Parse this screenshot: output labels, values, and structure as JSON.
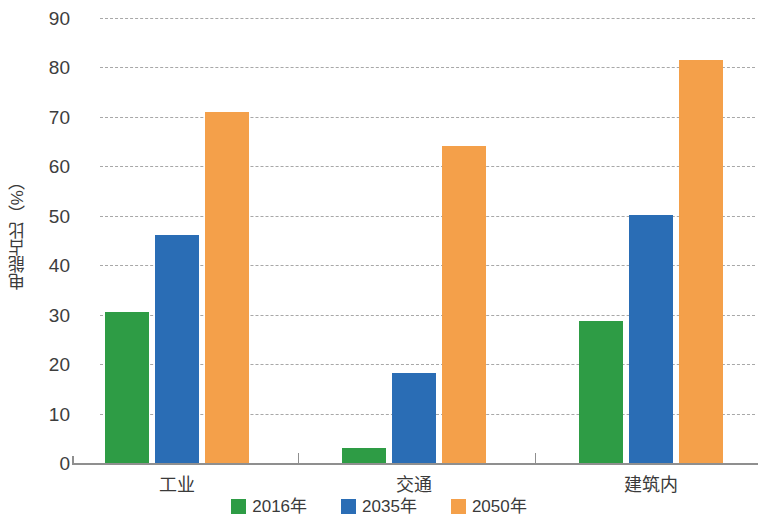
{
  "chart_data": {
    "type": "bar",
    "title": "",
    "xlabel": "",
    "ylabel": "电能占比（%）",
    "categories": [
      "工业",
      "交通",
      "建筑内"
    ],
    "series": [
      {
        "name": "2016年",
        "color": "#2e9c45",
        "values": [
          30.5,
          3.0,
          28.8
        ]
      },
      {
        "name": "2035年",
        "color": "#2a6db5",
        "values": [
          46.2,
          18.3,
          50.1
        ]
      },
      {
        "name": "2050年",
        "color": "#f4a04a",
        "values": [
          70.9,
          64.2,
          81.6
        ]
      }
    ],
    "ylim": [
      0,
      90
    ],
    "yticks": [
      0,
      10,
      20,
      30,
      40,
      50,
      60,
      70,
      80,
      90
    ],
    "ytick_labels": [
      "0",
      "10",
      "20",
      "30",
      "40",
      "50",
      "60",
      "70",
      "80",
      "90"
    ],
    "grid": true,
    "grid_style": "dashed-horizontal",
    "legend_position": "bottom-center"
  },
  "legend": {
    "items": [
      {
        "label": "2016年",
        "color": "#2e9c45"
      },
      {
        "label": "2035年",
        "color": "#2a6db5"
      },
      {
        "label": "2050年",
        "color": "#f4a04a"
      }
    ]
  },
  "axes": {
    "y_title": "电能占比（%）",
    "y_tick_labels": [
      "90",
      "80",
      "70",
      "60",
      "50",
      "40",
      "30",
      "20",
      "10",
      "0"
    ],
    "x_tick_labels": [
      "工业",
      "交通",
      "建筑内"
    ]
  }
}
